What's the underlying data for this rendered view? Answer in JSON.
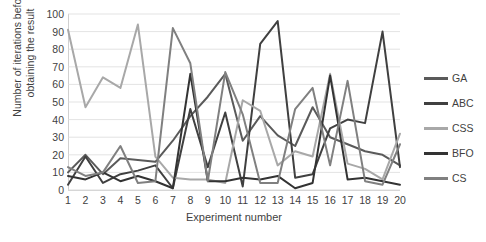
{
  "chart_data": {
    "type": "line",
    "title": "",
    "xlabel": "Experiment number",
    "ylabel": "Number of iterations before obtaining the result",
    "ylabel_line1": "Number of iterations before",
    "ylabel_line2": "obtaining the result",
    "xlim": [
      1,
      20
    ],
    "ylim": [
      0,
      100
    ],
    "grid": true,
    "legend_position": "right",
    "y_ticks": [
      0,
      10,
      20,
      30,
      40,
      50,
      60,
      70,
      80,
      90,
      100
    ],
    "x_ticks": [
      1,
      2,
      3,
      4,
      5,
      6,
      7,
      8,
      9,
      10,
      11,
      12,
      13,
      14,
      15,
      16,
      17,
      18,
      19,
      20
    ],
    "categories": [
      1,
      2,
      3,
      4,
      5,
      6,
      7,
      8,
      9,
      10,
      11,
      12,
      13,
      14,
      15,
      16,
      17,
      18,
      19,
      20
    ],
    "series": [
      {
        "name": "GA",
        "color": "#5a5a5a",
        "width": 2.0,
        "values": [
          10,
          20,
          9,
          18,
          17,
          16,
          28,
          42,
          53,
          66,
          28,
          42,
          31,
          25,
          47,
          30,
          26,
          22,
          20,
          14
        ]
      },
      {
        "name": "ABC",
        "color": "#404040",
        "width": 2.0,
        "values": [
          3,
          19,
          4,
          9,
          11,
          14,
          1,
          46,
          13,
          44,
          2,
          83,
          96,
          7,
          9,
          35,
          40,
          38,
          90,
          13
        ]
      },
      {
        "name": "CSS",
        "color": "#a8a8a8",
        "width": 2.0,
        "values": [
          91,
          47,
          64,
          58,
          94,
          19,
          7,
          6,
          6,
          4,
          51,
          45,
          14,
          22,
          19,
          66,
          15,
          12,
          6,
          32
        ]
      },
      {
        "name": "BFO",
        "color": "#333333",
        "width": 2.0,
        "values": [
          8,
          6,
          10,
          5,
          8,
          5,
          1,
          66,
          5,
          5,
          7,
          6,
          8,
          1,
          4,
          65,
          6,
          7,
          5,
          3
        ]
      },
      {
        "name": "CS",
        "color": "#808080",
        "width": 2.0,
        "values": [
          13,
          8,
          10,
          25,
          4,
          5,
          92,
          72,
          5,
          67,
          43,
          4,
          4,
          46,
          58,
          14,
          62,
          5,
          3,
          26
        ]
      }
    ]
  },
  "legend": {
    "items": [
      {
        "label": "GA"
      },
      {
        "label": "ABC"
      },
      {
        "label": "CSS"
      },
      {
        "label": "BFO"
      },
      {
        "label": "CS"
      }
    ]
  },
  "colors": {
    "grid": "#dcdcdc",
    "axis": "#d0d0d0",
    "text": "#3f3f3f",
    "background": "#ffffff"
  }
}
